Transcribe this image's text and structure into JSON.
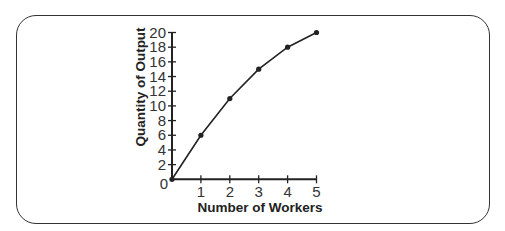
{
  "chart_data": {
    "type": "line",
    "title": "",
    "xlabel": "Number of Workers",
    "ylabel": "Quantity of Output",
    "x": [
      0,
      1,
      2,
      3,
      4,
      5
    ],
    "series": [
      {
        "name": "Output",
        "values": [
          0,
          6,
          11,
          15,
          18,
          20
        ],
        "color": "#222222"
      }
    ],
    "xlim": [
      0,
      5
    ],
    "ylim": [
      0,
      20
    ],
    "xticks": [
      1,
      2,
      3,
      4,
      5
    ],
    "yticks": [
      2,
      4,
      6,
      8,
      10,
      12,
      14,
      16,
      18,
      20
    ],
    "origin_label": "0",
    "grid": false,
    "legend": "none"
  }
}
